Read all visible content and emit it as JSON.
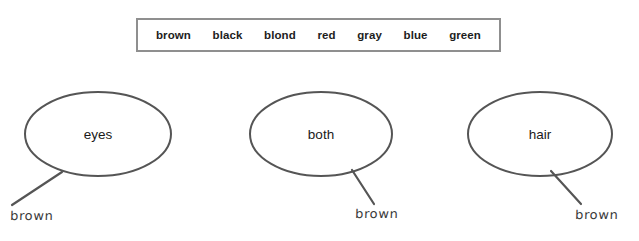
{
  "word_bank": {
    "name": "word-bank",
    "border_color": "#8f8f8f",
    "words": [
      {
        "label": "brown"
      },
      {
        "label": "black"
      },
      {
        "label": "blond"
      },
      {
        "label": "red"
      },
      {
        "label": "gray"
      },
      {
        "label": "blue"
      },
      {
        "label": "green"
      }
    ]
  },
  "diagram": {
    "stroke_color": "#555555",
    "text_color": "#1a1a1a",
    "handwriting_color": "#3b3b3b",
    "categories": [
      {
        "id": "eyes",
        "label": "eyes",
        "answer": "brown",
        "leader_direction": "down-left"
      },
      {
        "id": "both",
        "label": "both",
        "answer": "brown",
        "leader_direction": "down-right"
      },
      {
        "id": "hair",
        "label": "hair",
        "answer": "brown",
        "leader_direction": "down-right"
      }
    ]
  }
}
